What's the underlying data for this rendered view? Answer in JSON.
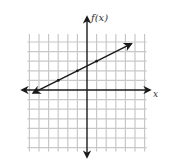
{
  "chart_data": {
    "type": "line",
    "title": "",
    "xlabel": "x",
    "ylabel": "f(x)",
    "grid": true,
    "xlim": [
      -6,
      6
    ],
    "ylim": [
      -6,
      5
    ],
    "legend": null,
    "series": [
      {
        "name": "f(x)",
        "equation": "f(x) = 0.5x + 2.5",
        "slope": 0.5,
        "intercept": 2.5,
        "marked_points": [
          [
            -3,
            1
          ],
          [
            -1,
            2
          ],
          [
            1,
            3
          ]
        ],
        "x": [
          -5.6,
          4.6
        ],
        "y": [
          -0.3,
          4.8
        ],
        "arrows_both_ends": true
      }
    ],
    "axes": {
      "arrows": true,
      "tick_labels": false
    }
  },
  "labels": {
    "x_axis": "x",
    "y_axis": "f(x)"
  },
  "colors": {
    "grid": "#c8c8c8",
    "axis": "#1a1a1a",
    "line": "#1a1a1a"
  }
}
